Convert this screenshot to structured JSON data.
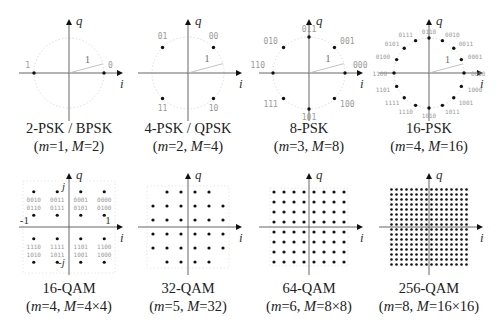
{
  "figure": {
    "panels": [
      {
        "id": "bpsk",
        "type": "psk",
        "title": "2-PSK / BPSK",
        "params": "(m=1, M=2)",
        "m": 1,
        "M": "2",
        "center": [
          69,
          73
        ],
        "radius": 35,
        "axis_labels": {
          "x": "i",
          "y": "q"
        },
        "radius_label": "1",
        "points": [
          {
            "angle": 0,
            "label": "0"
          },
          {
            "angle": 180,
            "label": "1"
          }
        ]
      },
      {
        "id": "qpsk",
        "type": "psk",
        "title": "4-PSK / QPSK",
        "params": "(m=2, M=4)",
        "m": 2,
        "M": "4",
        "center": [
          188,
          73
        ],
        "radius": 36,
        "axis_labels": {
          "x": "i",
          "y": "q"
        },
        "radius_label": "1",
        "points": [
          {
            "angle": 45,
            "label": "00"
          },
          {
            "angle": 135,
            "label": "01"
          },
          {
            "angle": 225,
            "label": "11"
          },
          {
            "angle": 315,
            "label": "10"
          }
        ]
      },
      {
        "id": "8psk",
        "type": "psk",
        "title": "8-PSK",
        "params": "(m=3, M=8)",
        "m": 3,
        "M": "8",
        "center": [
          309,
          73
        ],
        "radius": 36,
        "axis_labels": {
          "x": "i",
          "y": "q"
        },
        "radius_label": "1",
        "points": [
          {
            "angle": 0,
            "label": "000"
          },
          {
            "angle": 45,
            "label": "001"
          },
          {
            "angle": 90,
            "label": "011"
          },
          {
            "angle": 135,
            "label": "010"
          },
          {
            "angle": 180,
            "label": "110"
          },
          {
            "angle": 225,
            "label": "111"
          },
          {
            "angle": 270,
            "label": "101"
          },
          {
            "angle": 315,
            "label": "100"
          }
        ]
      },
      {
        "id": "16psk",
        "type": "psk",
        "title": "16-PSK",
        "params": "(m=4, M=16)",
        "m": 4,
        "M": "16",
        "center": [
          429,
          73
        ],
        "radius": 35,
        "axis_labels": {
          "x": "i",
          "y": "q"
        },
        "radius_label": "1",
        "points": [
          {
            "angle": 0,
            "label": "0000"
          },
          {
            "angle": 22.5,
            "label": "0001"
          },
          {
            "angle": 45,
            "label": "0011"
          },
          {
            "angle": 67.5,
            "label": "0010"
          },
          {
            "angle": 90,
            "label": "0110"
          },
          {
            "angle": 112.5,
            "label": "0111"
          },
          {
            "angle": 135,
            "label": "0101"
          },
          {
            "angle": 157.5,
            "label": "0100"
          },
          {
            "angle": 180,
            "label": "1100"
          },
          {
            "angle": 202.5,
            "label": "1101"
          },
          {
            "angle": 225,
            "label": "1111"
          },
          {
            "angle": 247.5,
            "label": "1110"
          },
          {
            "angle": 270,
            "label": "1010"
          },
          {
            "angle": 292.5,
            "label": "1011"
          },
          {
            "angle": 315,
            "label": "1001"
          },
          {
            "angle": 337.5,
            "label": "1000"
          }
        ]
      },
      {
        "id": "16qam",
        "type": "qam",
        "title": "16-QAM",
        "params": "(m=4, M=4×4)",
        "m": 4,
        "M": "4×4",
        "center": [
          69,
          227
        ],
        "grid": 4,
        "spacing": 23.5,
        "axis_labels": {
          "x": "i",
          "y": "q"
        },
        "tick_labels": {
          "j": "j",
          "neg_j": "-j",
          "one": "1",
          "neg_one": "-1"
        },
        "bit_labels": [
          [
            "0010",
            "0011",
            "0001",
            "0000"
          ],
          [
            "0110",
            "0111",
            "0101",
            "0100"
          ],
          [
            "1110",
            "1111",
            "1101",
            "1100"
          ],
          [
            "1010",
            "1011",
            "1001",
            "1000"
          ]
        ]
      },
      {
        "id": "32qam",
        "type": "qam-cross",
        "title": "32-QAM",
        "params": "(m=5, M=32)",
        "m": 5,
        "M": "32",
        "center": [
          188,
          227
        ],
        "grid": 6,
        "spacing": 14,
        "axis_labels": {
          "x": "i",
          "y": "q"
        }
      },
      {
        "id": "64qam",
        "type": "qam",
        "title": "64-QAM",
        "params": "(m=6, M=8×8)",
        "m": 6,
        "M": "8×8",
        "center": [
          309,
          227
        ],
        "grid": 8,
        "spacing": 10,
        "axis_labels": {
          "x": "i",
          "y": "q"
        }
      },
      {
        "id": "256qam",
        "type": "qam",
        "title": "256-QAM",
        "params": "(m=8, M=16×16)",
        "m": 8,
        "M": "16×16",
        "center": [
          429,
          227
        ],
        "grid": 16,
        "spacing": 5,
        "axis_labels": {
          "x": "i",
          "y": "q"
        }
      }
    ]
  },
  "captions": [
    {
      "title": "2-PSK / BPSK",
      "m": "1",
      "M": "2"
    },
    {
      "title": "4-PSK / QPSK",
      "m": "2",
      "M": "4"
    },
    {
      "title": "8-PSK",
      "m": "3",
      "M": "8"
    },
    {
      "title": "16-PSK",
      "m": "4",
      "M": "16"
    },
    {
      "title": "16-QAM",
      "m": "4",
      "M": "4×4"
    },
    {
      "title": "32-QAM",
      "m": "5",
      "M": "32"
    },
    {
      "title": "64-QAM",
      "m": "6",
      "M": "8×8"
    },
    {
      "title": "256-QAM",
      "m": "8",
      "M": "16×16"
    }
  ],
  "labels": {
    "m_sym": "m",
    "M_sym": "M",
    "eq": "=",
    "open": "(",
    "close": ")",
    "sep": ", "
  },
  "colors": {
    "axis": "#555555",
    "point": "#111111",
    "label": "#999999",
    "circle": "#d8d8d8",
    "text": "#222222"
  }
}
